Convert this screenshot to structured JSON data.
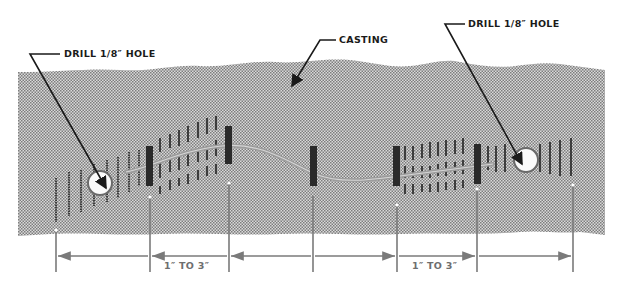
{
  "diagram": {
    "type": "technical-illustration",
    "labels": {
      "casting": "CASTING",
      "drill_left": "DRILL 1/8″ HOLE",
      "drill_right": "DRILL 1/8″ HOLE"
    },
    "dimensions": [
      {
        "id": "dim-left-span",
        "label": ""
      },
      {
        "id": "dim-left-spacing",
        "label": "1″ TO 3″"
      },
      {
        "id": "dim-middle-span",
        "label": ""
      },
      {
        "id": "dim-right-spacing",
        "label": "1″ TO 3″"
      },
      {
        "id": "dim-right-span",
        "label": ""
      }
    ],
    "elements": {
      "drilled_holes": 2,
      "locking_pins": 5,
      "crack": "wavy crack line between two drilled holes",
      "stitch_rows": "short vertical stitch marks across crack"
    },
    "colors": {
      "casting_fill": "#b9b9b9",
      "ink": "#1a1a1a",
      "dimension_lines": "#7a7a7a",
      "crack": "#9c9c9c",
      "pins": "#2a2a2a"
    }
  }
}
